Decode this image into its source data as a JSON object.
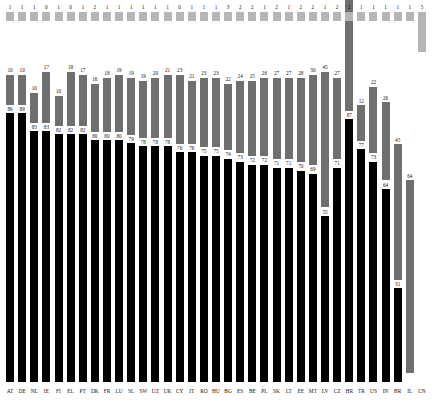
{
  "chart_data": {
    "type": "bar",
    "subtype": "stacked-bar",
    "title": "",
    "subtitle": "",
    "xlabel": "",
    "ylabel": "",
    "ylim": [
      0,
      100
    ],
    "grid": false,
    "legend": "none",
    "stacked": true,
    "value_labels": true,
    "categories": [
      "AT",
      "DE",
      "NL",
      "IE",
      "FI",
      "EL",
      "PT",
      "DK",
      "FR",
      "LU",
      "SL",
      "SW",
      "UZ",
      "UK",
      "CY",
      "IT",
      "RO",
      "HU",
      "BG",
      "ES",
      "BE",
      "PL",
      "SK",
      "LT",
      "EE",
      "MT",
      "LV",
      "CZ",
      "HR",
      "TR",
      "US",
      "IN",
      "BR",
      "IL",
      "CN"
    ],
    "series": [
      {
        "name": "bottom",
        "color": "#000000",
        "values": [
          89,
          89,
          83,
          83,
          82,
          82,
          82,
          80,
          80,
          80,
          79,
          78,
          78,
          78,
          76,
          76,
          75,
          75,
          74,
          73,
          72,
          72,
          71,
          71,
          70,
          69,
          55,
          71,
          87,
          77,
          73,
          64,
          31,
          0,
          0
        ]
      },
      {
        "name": "middle",
        "color": "#6f6f6f",
        "values": [
          10,
          10,
          10,
          17,
          10,
          18,
          17,
          16,
          18,
          19,
          19,
          19,
          20,
          21,
          23,
          21,
          23,
          23,
          22,
          24,
          25,
          26,
          27,
          27,
          28,
          30,
          45,
          27,
          67,
          12,
          22,
          26,
          45,
          64,
          0
        ]
      },
      {
        "name": "top",
        "color": "#b6b6b6",
        "values": [
          1,
          1,
          1,
          0,
          1,
          0,
          1,
          2,
          1,
          1,
          1,
          1,
          1,
          1,
          0,
          1,
          1,
          1,
          3,
          2,
          2,
          1,
          2,
          1,
          2,
          2,
          1,
          2,
          2,
          1,
          1,
          1,
          1,
          1,
          5
        ]
      }
    ]
  },
  "axis": {
    "tick_labels": [
      "AT",
      "DE",
      "NL",
      "IE",
      "FI",
      "EL",
      "PT",
      "DK",
      "FR",
      "LU",
      "SL",
      "SW",
      "UZ",
      "UK",
      "CY",
      "IT",
      "RO",
      "HU",
      "BG",
      "ES",
      "BE",
      "PL",
      "SK",
      "LT",
      "EE",
      "MT",
      "LV",
      "CZ",
      "HR",
      "TR",
      "US",
      "IN",
      "BR",
      "IL",
      "CN"
    ]
  },
  "columns": [
    {
      "cat": "AT",
      "bottom": 89,
      "middle": 10,
      "top": 1
    },
    {
      "cat": "DE",
      "bottom": 89,
      "middle": 10,
      "top": 1
    },
    {
      "cat": "NL",
      "bottom": 83,
      "middle": 10,
      "top": 1
    },
    {
      "cat": "IE",
      "bottom": 83,
      "middle": 17,
      "top": 0
    },
    {
      "cat": "FI",
      "bottom": 82,
      "middle": 10,
      "top": 1
    },
    {
      "cat": "EL",
      "bottom": 82,
      "middle": 18,
      "top": 0
    },
    {
      "cat": "PT",
      "bottom": 82,
      "middle": 17,
      "top": 1
    },
    {
      "cat": "DK",
      "bottom": 80,
      "middle": 16,
      "top": 2
    },
    {
      "cat": "FR",
      "bottom": 80,
      "middle": 18,
      "top": 1
    },
    {
      "cat": "LU",
      "bottom": 80,
      "middle": 19,
      "top": 1
    },
    {
      "cat": "SL",
      "bottom": 79,
      "middle": 19,
      "top": 1
    },
    {
      "cat": "SW",
      "bottom": 78,
      "middle": 19,
      "top": 1
    },
    {
      "cat": "UZ",
      "bottom": 78,
      "middle": 20,
      "top": 1
    },
    {
      "cat": "UK",
      "bottom": 78,
      "middle": 21,
      "top": 1
    },
    {
      "cat": "CY",
      "bottom": 76,
      "middle": 23,
      "top": 0
    },
    {
      "cat": "IT",
      "bottom": 76,
      "middle": 21,
      "top": 1
    },
    {
      "cat": "RO",
      "bottom": 75,
      "middle": 23,
      "top": 1
    },
    {
      "cat": "HU",
      "bottom": 75,
      "middle": 23,
      "top": 1
    },
    {
      "cat": "BG",
      "bottom": 74,
      "middle": 22,
      "top": 3
    },
    {
      "cat": "ES",
      "bottom": 73,
      "middle": 24,
      "top": 2
    },
    {
      "cat": "BE",
      "bottom": 72,
      "middle": 25,
      "top": 2
    },
    {
      "cat": "PL",
      "bottom": 72,
      "middle": 26,
      "top": 2
    },
    {
      "cat": "SK",
      "bottom": 71,
      "middle": 27,
      "top": 1
    },
    {
      "cat": "LT",
      "bottom": 71,
      "middle": 27,
      "top": 2
    },
    {
      "cat": "EE",
      "bottom": 70,
      "middle": 27,
      "top": 1
    },
    {
      "cat": "MT",
      "bottom": 69,
      "middle": 28,
      "top": 1
    },
    {
      "cat": "LV",
      "bottom": 55,
      "middle": 45,
      "top": 1
    },
    {
      "cat": "CZ",
      "bottom": 71,
      "middle": 27,
      "top": 1
    },
    {
      "cat": "HR",
      "bottom": 87,
      "middle": 12,
      "top": 1
    },
    {
      "cat": "TR",
      "bottom": 77,
      "middle": 22,
      "top": 1
    },
    {
      "cat": "US",
      "bottom": 73,
      "middle": 26,
      "top": 1
    },
    {
      "cat": "IN",
      "bottom": 64,
      "middle": 45,
      "top": 1
    },
    {
      "cat": "BR",
      "bottom": 31,
      "middle": 64,
      "top": 5
    },
    {
      "cat": "IL",
      "bottom": 0,
      "middle": 0,
      "top": 0
    },
    {
      "cat": "CN",
      "bottom": 0,
      "middle": 0,
      "top": 0
    }
  ]
}
